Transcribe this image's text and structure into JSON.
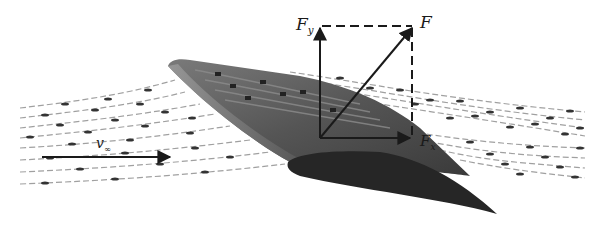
{
  "figure": {
    "labels": {
      "resultant_force": "F",
      "lift_force_main": "F",
      "lift_force_sub": "y",
      "drag_force_main": "F",
      "drag_force_sub": "x",
      "velocity_main": "v",
      "velocity_sub": "∞"
    },
    "colors": {
      "background": "#ffffff",
      "wing_top": "#5a5a5a",
      "wing_leading_edge": "#8a8a8a",
      "wing_section": "#222222",
      "streamline": "#9a9a9a",
      "streamline_dot": "#333333",
      "vector": "#1a1a1a"
    }
  }
}
